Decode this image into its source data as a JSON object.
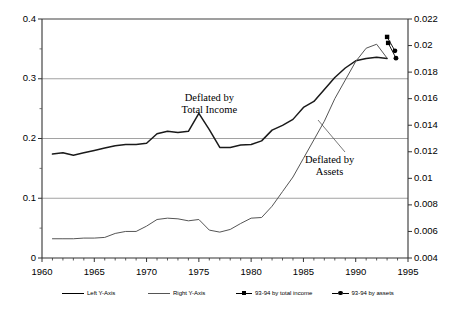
{
  "chart_data": {
    "type": "line",
    "title": "",
    "xlabel": "",
    "ylabel_left": "",
    "ylabel_right": "",
    "xlim": [
      1960,
      1995
    ],
    "ylim_left": [
      0,
      0.4
    ],
    "ylim_right": [
      0.004,
      0.022
    ],
    "grid": true,
    "legend_position": "bottom",
    "x_ticks": [
      "1960",
      "1965",
      "1970",
      "1975",
      "1980",
      "1985",
      "1990",
      "1995"
    ],
    "x_tick_values": [
      1960,
      1965,
      1970,
      1975,
      1980,
      1985,
      1990,
      1995
    ],
    "y_ticks_left": [
      "0",
      "0.1",
      "0.2",
      "0.3",
      "0.4"
    ],
    "y_tick_values_left": [
      0,
      0.1,
      0.2,
      0.3,
      0.4
    ],
    "y_minor_left": [
      0.05,
      0.15,
      0.25,
      0.35
    ],
    "y_ticks_right": [
      "0.004",
      "0.006",
      "0.008",
      "0.01",
      "0.012",
      "0.014",
      "0.016",
      "0.018",
      "0.02",
      "0.022"
    ],
    "y_tick_values_right": [
      0.004,
      0.006,
      0.008,
      0.01,
      0.012,
      0.014,
      0.016,
      0.018,
      0.02,
      0.022
    ],
    "annotations": [
      {
        "text_line1": "Deflated by",
        "text_line2": "Total Income",
        "x": 1976,
        "y": 0.265
      },
      {
        "text_line1": "Deflated by",
        "text_line2": "Assets",
        "x": 1987.5,
        "y": 0.16
      }
    ],
    "series": [
      {
        "name": "Left Y-Axis",
        "axis": "left",
        "color": "#1a1a1a",
        "x": [
          1961,
          1962,
          1963,
          1964,
          1965,
          1966,
          1967,
          1968,
          1969,
          1970,
          1971,
          1972,
          1973,
          1974,
          1975,
          1976,
          1977,
          1978,
          1979,
          1980,
          1981,
          1982,
          1983,
          1984,
          1985,
          1986,
          1987,
          1988,
          1989,
          1990,
          1991,
          1992,
          1993
        ],
        "values": [
          0.174,
          0.176,
          0.172,
          0.176,
          0.18,
          0.184,
          0.188,
          0.19,
          0.19,
          0.192,
          0.208,
          0.212,
          0.21,
          0.212,
          0.242,
          0.215,
          0.185,
          0.185,
          0.189,
          0.19,
          0.196,
          0.214,
          0.222,
          0.232,
          0.252,
          0.262,
          0.282,
          0.302,
          0.318,
          0.33,
          0.334,
          0.336,
          0.334
        ]
      },
      {
        "name": "Right Y-Axis",
        "axis": "right",
        "color": "#555555",
        "x": [
          1961,
          1962,
          1963,
          1964,
          1965,
          1966,
          1967,
          1968,
          1969,
          1970,
          1971,
          1972,
          1973,
          1974,
          1975,
          1976,
          1977,
          1978,
          1979,
          1980,
          1981,
          1982,
          1983,
          1984,
          1985,
          1986,
          1987,
          1988,
          1989,
          1990,
          1991,
          1992,
          1993
        ],
        "values": [
          0.00545,
          0.00545,
          0.00545,
          0.0055,
          0.0055,
          0.00555,
          0.00585,
          0.006,
          0.006,
          0.0064,
          0.0069,
          0.007,
          0.00695,
          0.0068,
          0.0069,
          0.0061,
          0.00595,
          0.00615,
          0.0066,
          0.007,
          0.00705,
          0.0079,
          0.009,
          0.0101,
          0.0115,
          0.0129,
          0.0143,
          0.016,
          0.0174,
          0.0188,
          0.0198,
          0.0201,
          0.01905
        ]
      }
    ],
    "markers": [
      {
        "label": "93-94 by total income",
        "shape": "square",
        "x": 1993.0,
        "y_right": 0.02065
      },
      {
        "label": "93-94 by total income",
        "shape": "square",
        "x": 1993.1,
        "y_right": 0.0202
      },
      {
        "label": "93-94 by assets",
        "shape": "circle",
        "x": 1993.75,
        "y_right": 0.0196
      },
      {
        "label": "93-94 by assets",
        "shape": "circle",
        "x": 1993.85,
        "y_right": 0.01905
      }
    ],
    "legend": [
      {
        "label": "Left Y-Axis",
        "type": "line",
        "color": "#000000"
      },
      {
        "label": "Right Y-Axis",
        "type": "line",
        "color": "#555555"
      },
      {
        "label": "93-94 by total income",
        "type": "line-marker-square",
        "color": "#000000"
      },
      {
        "label": "93-94 by assets",
        "type": "line-marker-circle",
        "color": "#000000"
      }
    ]
  }
}
